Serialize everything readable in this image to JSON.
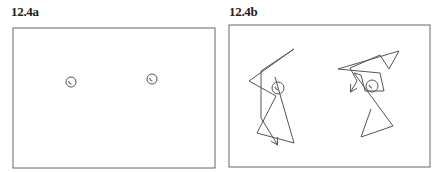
{
  "panels": [
    {
      "label": "12.4a",
      "frame": {
        "x": 13,
        "y": 28,
        "w": 202,
        "h": 140
      },
      "circles": [
        {
          "cx": 71,
          "cy": 82,
          "r": 5
        },
        {
          "cx": 152,
          "cy": 79,
          "r": 5
        }
      ],
      "paths": []
    },
    {
      "label": "12.4b",
      "frame": {
        "x": 229,
        "y": 25,
        "w": 201,
        "h": 142
      },
      "circles": [
        {
          "cx": 278,
          "cy": 88,
          "r": 6
        },
        {
          "cx": 372,
          "cy": 86,
          "r": 6
        }
      ],
      "paths": [
        {
          "points": "275,77 294,143 257,133 276,96 249,81 294,49 261,71 261,118 277,144",
          "arrow_end": true
        },
        {
          "points": "371,109 361,137 393,126 354,73 361,75 365,91 384,91 380,73 338,69 399,51 389,69 380,55 350,68 357,81 351,91",
          "arrow_end": true
        }
      ]
    }
  ],
  "colors": {
    "stroke": "#555555",
    "frame": "#666666",
    "text": "#222222"
  }
}
